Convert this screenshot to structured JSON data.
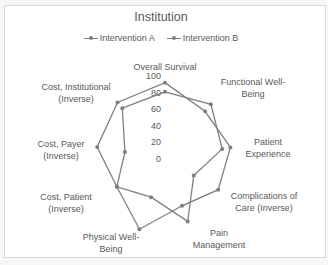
{
  "chart_data": {
    "type": "radar",
    "title": "Institution",
    "categories": [
      "Overall Survival",
      "Functional Well-Being",
      "Patient Experience",
      "Complications of Care (Inverse)",
      "Pain Management",
      "Physical Well-Being",
      "Cost, Patient (Inverse)",
      "Cost, Payer (Inverse)",
      "Cost, Institutional (Inverse)"
    ],
    "series": [
      {
        "name": "Intervention A",
        "values": [
          92,
          75,
          80,
          74,
          60,
          90,
          67,
          83,
          89
        ],
        "color": "#7f7f7f"
      },
      {
        "name": "Intervention B",
        "values": [
          81,
          86,
          70,
          40,
          80,
          49,
          67,
          49,
          80
        ],
        "color": "#7f7f7f"
      }
    ],
    "ticks": [
      0,
      20,
      40,
      60,
      80,
      100
    ],
    "rlim": [
      0,
      100
    ],
    "grid": false,
    "legend_position": "top"
  },
  "category_label_lines": [
    [
      "Overall Survival"
    ],
    [
      "Functional Well-",
      "Being"
    ],
    [
      "Patient",
      "Experience"
    ],
    [
      "Complications of",
      "Care (Inverse)"
    ],
    [
      "Pain",
      "Management"
    ],
    [
      "Physical Well-",
      "Being"
    ],
    [
      "Cost, Patient",
      "(Inverse)"
    ],
    [
      "Cost, Payer",
      "(Inverse)"
    ],
    [
      "Cost, Institutional",
      "(Inverse)"
    ]
  ],
  "legend": {
    "items": [
      {
        "label": "Intervention A"
      },
      {
        "label": "Intervention B"
      }
    ]
  }
}
